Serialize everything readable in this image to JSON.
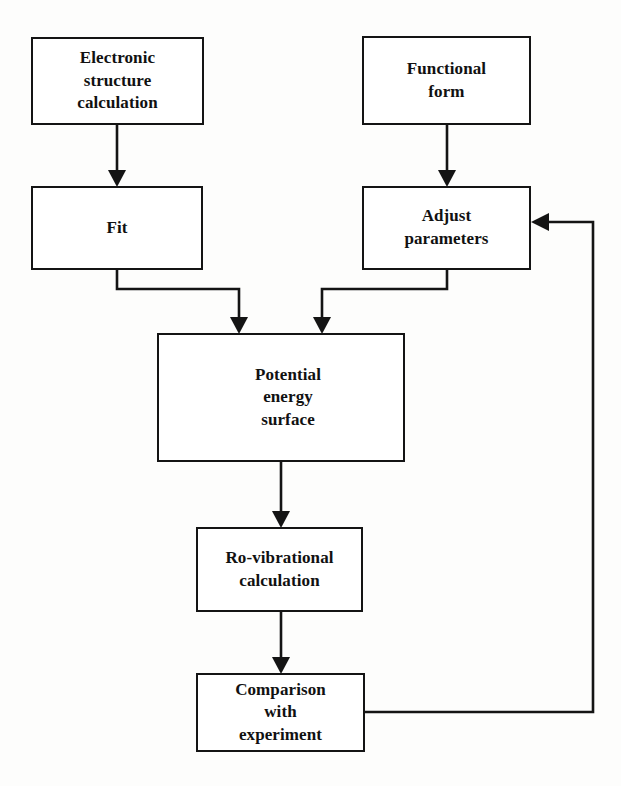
{
  "diagram": {
    "type": "flowchart",
    "background_color": "#fdfdfc",
    "line_color": "#141414",
    "box_fill_color": "#ffffff",
    "nodes": [
      {
        "id": "electronic-structure-calculation",
        "label": "Electronic\nstructure\ncalculation",
        "x": 31,
        "y": 37,
        "w": 173,
        "h": 88
      },
      {
        "id": "functional-form",
        "label": "Functional\nform",
        "x": 362,
        "y": 36,
        "w": 169,
        "h": 89
      },
      {
        "id": "fit",
        "label": "Fit",
        "x": 31,
        "y": 186,
        "w": 172,
        "h": 84
      },
      {
        "id": "adjust-parameters",
        "label": "Adjust\nparameters",
        "x": 362,
        "y": 186,
        "w": 169,
        "h": 84
      },
      {
        "id": "potential-energy-surface",
        "label": "Potential\nenergy\nsurface",
        "x": 157,
        "y": 333,
        "w": 248,
        "h": 129
      },
      {
        "id": "ro-vibrational-calculation",
        "label": "Ro-vibrational\ncalculation",
        "x": 196,
        "y": 527,
        "w": 167,
        "h": 85
      },
      {
        "id": "comparison-with-experiment",
        "label": "Comparison\nwith\nexperiment",
        "x": 196,
        "y": 673,
        "w": 169,
        "h": 79
      }
    ],
    "edges": [
      {
        "id": "edge-electronic-structure-to-fit",
        "from": "electronic-structure-calculation",
        "to": "fit",
        "kind": "straight-down-arrow"
      },
      {
        "id": "edge-functional-form-to-adjust-parameters",
        "from": "functional-form",
        "to": "adjust-parameters",
        "kind": "straight-down-arrow"
      },
      {
        "id": "edge-fit-to-potential-energy-surface",
        "from": "fit",
        "to": "potential-energy-surface",
        "kind": "step-right-down-arrow"
      },
      {
        "id": "edge-adjust-parameters-to-potential-energy-surface",
        "from": "adjust-parameters",
        "to": "potential-energy-surface",
        "kind": "step-left-down-arrow"
      },
      {
        "id": "edge-potential-energy-surface-to-ro-vibrational",
        "from": "potential-energy-surface",
        "to": "ro-vibrational-calculation",
        "kind": "straight-down-arrow"
      },
      {
        "id": "edge-ro-vibrational-to-comparison",
        "from": "ro-vibrational-calculation",
        "to": "comparison-with-experiment",
        "kind": "straight-down-arrow"
      },
      {
        "id": "edge-comparison-feedback-to-adjust-parameters",
        "from": "comparison-with-experiment",
        "to": "adjust-parameters",
        "kind": "feedback-loop-right-up-left-arrow"
      }
    ]
  }
}
